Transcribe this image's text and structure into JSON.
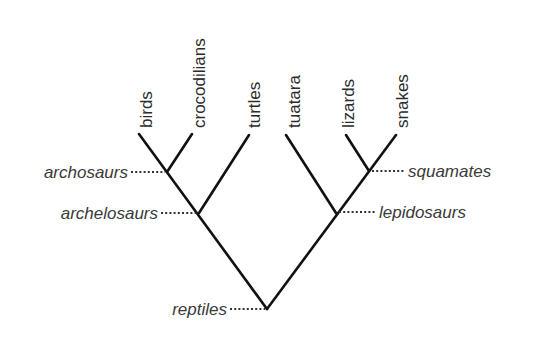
{
  "diagram": {
    "type": "cladogram",
    "title": "",
    "taxa": [
      {
        "label": "birds",
        "x": 139,
        "y": 134
      },
      {
        "label": "crocodilians",
        "x": 192,
        "y": 134
      },
      {
        "label": "turtles",
        "x": 249,
        "y": 135
      },
      {
        "label": "tuatara",
        "x": 286,
        "y": 135
      },
      {
        "label": "lizards",
        "x": 346,
        "y": 135
      },
      {
        "label": "snakes",
        "x": 396,
        "y": 135
      }
    ],
    "clades": [
      {
        "label": "archosaurs",
        "members": [
          "birds",
          "crocodilians"
        ],
        "side": "left"
      },
      {
        "label": "archelosaurs",
        "members": [
          "birds",
          "crocodilians",
          "turtles"
        ],
        "side": "left"
      },
      {
        "label": "squamates",
        "members": [
          "lizards",
          "snakes"
        ],
        "side": "right"
      },
      {
        "label": "lepidosaurs",
        "members": [
          "tuatara",
          "lizards",
          "snakes"
        ],
        "side": "right"
      },
      {
        "label": "reptiles",
        "members": [
          "birds",
          "crocodilians",
          "turtles",
          "tuatara",
          "lizards",
          "snakes"
        ],
        "side": "left"
      }
    ],
    "colors": {
      "branch": "#111111",
      "text": "#2b2b2b",
      "background": "#ffffff"
    }
  }
}
